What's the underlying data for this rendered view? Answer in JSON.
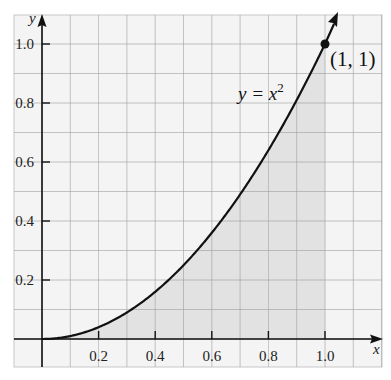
{
  "chart_data": {
    "type": "area",
    "title": "",
    "function": "y = x^2",
    "xlabel": "x",
    "ylabel": "y",
    "xlim": [
      -0.1,
      1.2
    ],
    "ylim": [
      -0.1,
      1.1
    ],
    "grid": true,
    "grid_step": 0.1,
    "x_ticks": [
      0.2,
      0.4,
      0.6,
      0.8,
      1.0
    ],
    "x_tick_labels": [
      "0.2",
      "0.4",
      "0.6",
      "0.8",
      "1.0"
    ],
    "y_ticks": [
      0.2,
      0.4,
      0.6,
      0.8,
      1.0
    ],
    "y_tick_labels": [
      "0.2",
      "0.4",
      "0.6",
      "0.8",
      "1.0"
    ],
    "series": [
      {
        "name": "y = x^2",
        "x": [
          0,
          0.1,
          0.2,
          0.3,
          0.4,
          0.5,
          0.6,
          0.7,
          0.8,
          0.9,
          1.0
        ],
        "values": [
          0,
          0.01,
          0.04,
          0.09,
          0.16,
          0.25,
          0.36,
          0.49,
          0.64,
          0.81,
          1.0
        ]
      }
    ],
    "shaded_region": {
      "under": "y = x^2",
      "from_x": 0,
      "to_x": 1.0
    },
    "annotations": [
      {
        "text": "y = x",
        "superscript": "2",
        "near": [
          0.72,
          0.84
        ]
      },
      {
        "text": "(1, 1)",
        "point": [
          1,
          1
        ]
      }
    ]
  },
  "labels": {
    "x_axis": "x",
    "y_axis": "y",
    "equation_main": "y = x",
    "equation_sup": "2",
    "point": "(1, 1)"
  },
  "colors": {
    "grid": "#9a9a9a",
    "frame": "#c8c8c8",
    "background": "#f4f4f4",
    "shade": "#dcdcdc",
    "curve": "#111111"
  }
}
